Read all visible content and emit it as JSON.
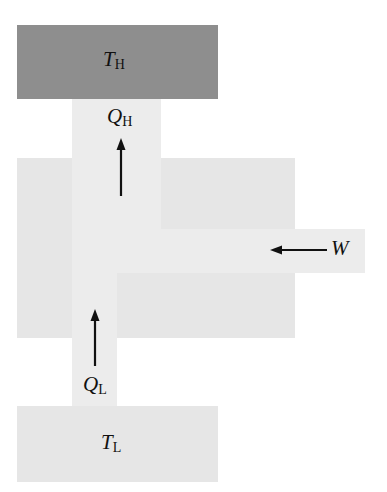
{
  "diagram": {
    "type": "refrigerator / heat pump energy flow",
    "hot_reservoir": {
      "symbol": "T",
      "subscript": "H",
      "color": "#8e8e8e"
    },
    "cold_reservoir": {
      "symbol": "T",
      "subscript": "L",
      "color": "#e6e6e6"
    },
    "heat_out": {
      "symbol": "Q",
      "subscript": "H",
      "direction": "up"
    },
    "heat_in": {
      "symbol": "Q",
      "subscript": "L",
      "direction": "up"
    },
    "work_in": {
      "symbol": "W",
      "direction": "left"
    },
    "device_color": "#e6e6e6",
    "arrow_color": "#111111"
  }
}
